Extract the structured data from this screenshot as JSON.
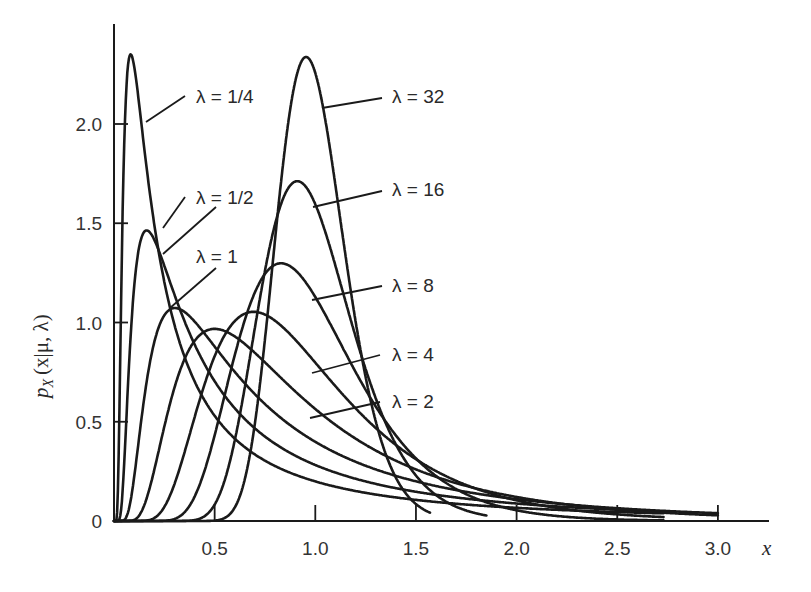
{
  "chart_data": {
    "type": "line",
    "title": "",
    "xlabel": "x",
    "ylabel": "p_X(x | μ, λ)",
    "xlim": [
      0,
      3.0
    ],
    "ylim": [
      0,
      2.4
    ],
    "grid": false,
    "legend_position": "inline-annotations",
    "x_ticks": [
      {
        "value": 0.5,
        "label": "0.5"
      },
      {
        "value": 1.0,
        "label": "1.0"
      },
      {
        "value": 1.5,
        "label": "1.5"
      },
      {
        "value": 2.0,
        "label": "2.0"
      },
      {
        "value": 2.5,
        "label": "2.5"
      },
      {
        "value": 3.0,
        "label": "3.0"
      }
    ],
    "y_ticks": [
      {
        "value": 0,
        "label": "0"
      },
      {
        "value": 0.5,
        "label": "0.5"
      },
      {
        "value": 1.0,
        "label": "1.0"
      },
      {
        "value": 1.5,
        "label": "1.5"
      },
      {
        "value": 2.0,
        "label": "2.0"
      }
    ],
    "distribution": "inverse Gaussian, μ = 1",
    "series": [
      {
        "name": "λ = 1/4",
        "lambda": 0.25,
        "peak_x": 0.08,
        "peak_y": 2.33,
        "x_end": 2.73
      },
      {
        "name": "λ = 1/2",
        "lambda": 0.5,
        "peak_x": 0.15,
        "peak_y": 1.44,
        "x_end": 2.73
      },
      {
        "name": "λ = 1",
        "lambda": 1,
        "peak_x": 0.28,
        "peak_y": 1.04,
        "x_end": 3.0
      },
      {
        "name": "λ = 2",
        "lambda": 2,
        "peak_x": 0.46,
        "peak_y": 0.95,
        "x_end": 3.0
      },
      {
        "name": "λ = 4",
        "lambda": 4,
        "peak_x": 0.65,
        "peak_y": 1.04,
        "x_end": 2.73
      },
      {
        "name": "λ = 8",
        "lambda": 8,
        "peak_x": 0.81,
        "peak_y": 1.28,
        "x_end": 2.73
      },
      {
        "name": "λ = 16",
        "lambda": 16,
        "peak_x": 0.91,
        "peak_y": 1.71,
        "x_end": 1.85
      },
      {
        "name": "λ = 32",
        "lambda": 32,
        "peak_x": 0.95,
        "peak_y": 2.33,
        "x_end": 1.57
      }
    ]
  },
  "labels": {
    "axis_x_title": "x",
    "axis_y_title_main": "p",
    "axis_y_title_sub": "X",
    "axis_y_title_args": "(x|μ, λ)",
    "curve_labels": [
      {
        "id": "l025",
        "text": "λ = 1/4"
      },
      {
        "id": "l05",
        "text": "λ = 1/2"
      },
      {
        "id": "l1",
        "text": "λ = 1"
      },
      {
        "id": "l32",
        "text": "λ = 32"
      },
      {
        "id": "l16",
        "text": "λ = 16"
      },
      {
        "id": "l8",
        "text": "λ = 8"
      },
      {
        "id": "l4",
        "text": "λ = 4"
      },
      {
        "id": "l2",
        "text": "λ = 2"
      }
    ]
  }
}
